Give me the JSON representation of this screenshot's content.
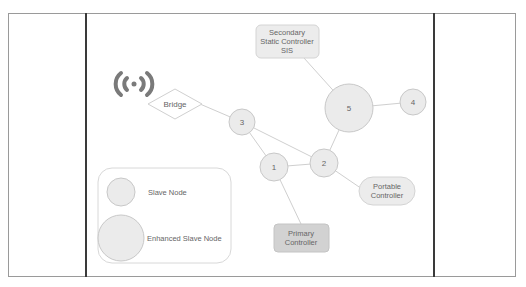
{
  "diagram": {
    "broadcast_icon": "wireless-broadcast-icon",
    "bridge": {
      "label": "Bridge"
    },
    "nodes": [
      {
        "id": "1",
        "label": "1",
        "type": "slave"
      },
      {
        "id": "2",
        "label": "2",
        "type": "slave"
      },
      {
        "id": "3",
        "label": "3",
        "type": "slave"
      },
      {
        "id": "4",
        "label": "4",
        "type": "slave"
      },
      {
        "id": "5",
        "label": "5",
        "type": "enhanced-slave"
      }
    ],
    "controllers": {
      "secondary": {
        "line1": "Secondary",
        "line2": "Static Controller",
        "line3": "SIS"
      },
      "portable": {
        "line1": "Portable",
        "line2": "Controller"
      },
      "primary": {
        "line1": "Primary",
        "line2": "Controller"
      }
    },
    "edges": [
      [
        "Bridge",
        "3"
      ],
      [
        "3",
        "1"
      ],
      [
        "3",
        "2"
      ],
      [
        "1",
        "2"
      ],
      [
        "2",
        "5"
      ],
      [
        "5",
        "4"
      ],
      [
        "5",
        "Secondary"
      ],
      [
        "2",
        "Portable"
      ],
      [
        "1",
        "Primary"
      ]
    ],
    "legend": {
      "slave_label": "Slave Node",
      "enhanced_label": "Enhanced Slave Node"
    },
    "colors": {
      "node_fill": "#ebebeb",
      "node_stroke": "#c8c8c8",
      "primary_fill": "#d2d2d2",
      "edge": "#cfcfcf",
      "icon": "#7a7a7a"
    }
  }
}
